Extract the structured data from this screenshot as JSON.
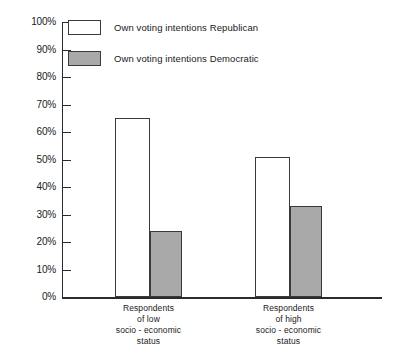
{
  "chart_data": {
    "type": "bar",
    "title": "",
    "xlabel": "",
    "ylabel": "",
    "ylim": [
      0,
      100
    ],
    "grid": false,
    "legend_position": "top-left",
    "categories": [
      "Respondents of low socio - economic status",
      "Respondents of high socio - economic status"
    ],
    "category_lines": [
      [
        "Respondents",
        "of low",
        "socio - economic",
        "status"
      ],
      [
        "Respondents",
        "of high",
        "socio - economic",
        "status"
      ]
    ],
    "series": [
      {
        "name": "Own voting intentions Republican",
        "values": [
          65,
          51
        ],
        "color": "#ffffff"
      },
      {
        "name": "Own voting intentions Democratic",
        "values": [
          24,
          33
        ],
        "color": "#a9a9a9"
      }
    ],
    "y_ticks": [
      {
        "value": 100,
        "label": "100%"
      },
      {
        "value": 90,
        "label": "90%"
      },
      {
        "value": 80,
        "label": "80%"
      },
      {
        "value": 70,
        "label": "70%"
      },
      {
        "value": 60,
        "label": "60%"
      },
      {
        "value": 50,
        "label": "50%"
      },
      {
        "value": 40,
        "label": "40%"
      },
      {
        "value": 30,
        "label": "30%"
      },
      {
        "value": 20,
        "label": "20%"
      },
      {
        "value": 10,
        "label": "10%"
      },
      {
        "value": 0,
        "label": "0%"
      }
    ]
  },
  "legend": {
    "items": [
      {
        "label": "Own voting intentions Republican",
        "swatch": "republican-swatch"
      },
      {
        "label": "Own voting intentions Democratic",
        "swatch": "democratic-swatch"
      }
    ]
  },
  "axis": {
    "y_labels": [
      "100%",
      "90%",
      "80%",
      "70%",
      "60%",
      "50%",
      "40%",
      "30%",
      "20%",
      "10%",
      "0%"
    ]
  },
  "groups": [
    {
      "lines": [
        "Respondents",
        "of low",
        "socio - economic",
        "status"
      ]
    },
    {
      "lines": [
        "Respondents",
        "of high",
        "socio - economic",
        "status"
      ]
    }
  ],
  "colors": {
    "republican": "#ffffff",
    "democratic": "#a9a9a9",
    "axis": "#2b2b2b",
    "outline": "#3a3a3a"
  }
}
